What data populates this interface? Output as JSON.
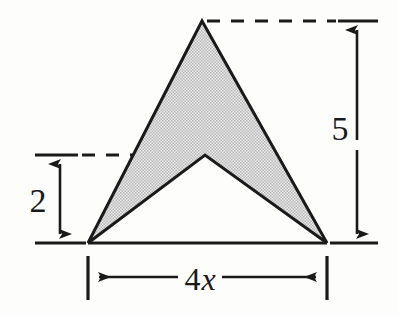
{
  "figure": {
    "shape_name": "shaded-chevron",
    "background_color": "#fdfdfc",
    "outline_color": "#1a1a1a",
    "fill_color": "#d8d8d8",
    "fill_pattern": "fine stipple dot checkerboard",
    "vertices": {
      "left_base": [
        88,
        243
      ],
      "apex": [
        202,
        21
      ],
      "right_base": [
        327,
        243
      ],
      "notch": [
        205,
        155
      ]
    },
    "dimensions": [
      {
        "name": "height-total",
        "label": "5",
        "orientation": "vertical",
        "arrow_x": 357,
        "from_y": 21,
        "to_y": 243,
        "label_x": 340,
        "label_y": 137
      },
      {
        "name": "height-notch",
        "label": "2",
        "orientation": "vertical",
        "arrow_x": 60,
        "from_y": 155,
        "to_y": 243,
        "label_x": 30,
        "label_y": 212
      },
      {
        "name": "base-width",
        "label_number": "4",
        "label_variable": "x",
        "label": "4x",
        "orientation": "horizontal",
        "arrow_y": 277,
        "from_x": 88,
        "to_x": 327,
        "label_x": 190,
        "label_y": 289
      }
    ],
    "extension_lines": [
      {
        "name": "top-dashed-line",
        "y": 21,
        "from_x": 206,
        "to_x": 378,
        "style": "dashed-then-solid"
      },
      {
        "name": "mid-dashed-line",
        "y": 155,
        "from_x": 35,
        "to_x": 205,
        "style": "solid-then-dashed"
      },
      {
        "name": "baseline",
        "y": 243,
        "from_x": 35,
        "to_x": 378,
        "style": "solid"
      }
    ],
    "tick_marks": [
      {
        "name": "left-base-tick",
        "x": 88,
        "from_y": 256,
        "to_y": 300
      },
      {
        "name": "right-base-tick",
        "x": 327,
        "from_y": 256,
        "to_y": 300
      }
    ]
  }
}
